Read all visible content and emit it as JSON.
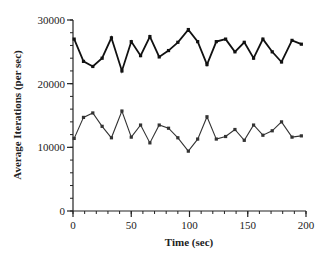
{
  "chart_data": {
    "type": "line",
    "title": "",
    "xlabel": "Time (sec)",
    "ylabel": "Average Iterations (per sec)",
    "xlim": [
      0,
      200
    ],
    "ylim": [
      0,
      30000
    ],
    "xticks": [
      0,
      50,
      100,
      150,
      200
    ],
    "yticks": [
      0,
      10000,
      20000,
      30000
    ],
    "grid": false,
    "legend": null,
    "x": [
      1,
      9,
      17,
      25,
      33,
      42,
      50,
      58,
      66,
      74,
      82,
      90,
      99,
      107,
      115,
      123,
      131,
      139,
      147,
      155,
      163,
      171,
      179,
      188,
      196
    ],
    "series": [
      {
        "name": "upper",
        "color": "#111111",
        "values": [
          27000,
          23500,
          22700,
          24000,
          27200,
          22000,
          26600,
          24400,
          27400,
          24200,
          25200,
          26500,
          28500,
          26600,
          23000,
          26600,
          27000,
          25000,
          26500,
          24000,
          27000,
          25000,
          23400,
          26800,
          26200
        ]
      },
      {
        "name": "lower",
        "color": "#333333",
        "values": [
          11400,
          14700,
          15400,
          13300,
          11500,
          15700,
          11600,
          13500,
          10700,
          13500,
          13000,
          11500,
          9400,
          11300,
          14800,
          11300,
          11700,
          12800,
          11100,
          13500,
          11900,
          12600,
          14000,
          11600,
          11800
        ]
      }
    ]
  }
}
